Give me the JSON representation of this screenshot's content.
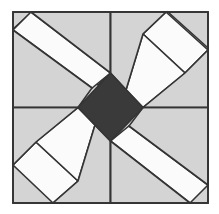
{
  "figure": {
    "type": "quilt-block-diagram",
    "width": 219,
    "height": 214,
    "background_color": "#ffffff",
    "symmetry": "180-degree rotational (2-fold)",
    "grid": "2x2 quadrants"
  },
  "palette": {
    "background": "#ffffff",
    "light_gray": "#d4d4d4",
    "white_patch": "#fbfbfb",
    "dark_gray": "#3a3a3a",
    "outline": "#343434",
    "outline_width": 1.6
  },
  "geometry": {
    "border": {
      "x0": 13,
      "y0": 12,
      "x1": 208,
      "y1": 203
    },
    "center": {
      "x": 110.5,
      "y": 107.5
    },
    "divider_vertical_x": 110.5,
    "divider_horizontal_y": 107.5,
    "center_diamond": {
      "top": [
        110.5,
        73
      ],
      "right": [
        143,
        107.5
      ],
      "bottom": [
        110.5,
        141
      ],
      "left": [
        78,
        107.5
      ],
      "fill": "dark_gray"
    }
  },
  "quadrants": [
    {
      "id": "top-left",
      "name": "Quadrant top-left",
      "description": "Light gray field with a single white diagonal band running from the upper-left corner toward the center, flanked by gray triangles."
    },
    {
      "id": "top-right",
      "name": "Quadrant top-right",
      "description": "Light gray field with a white chevron of two bands meeting near the center-left, opening toward the upper-right corner."
    },
    {
      "id": "bottom-left",
      "name": "Quadrant bottom-left",
      "description": "Light gray field with a white chevron of two bands meeting near the center-right, opening toward the lower-left corner."
    },
    {
      "id": "bottom-right",
      "name": "Quadrant bottom-right",
      "description": "Light gray field with a single white diagonal band running from the lower-right corner toward the center, flanked by gray triangles."
    }
  ],
  "pieces": [
    {
      "name": "outer-frame",
      "fill": "light_gray"
    },
    {
      "name": "center-diamond",
      "fill": "dark_gray"
    },
    {
      "name": "tl-white-band",
      "fill": "white_patch"
    },
    {
      "name": "tl-gray-corner-triangle",
      "fill": "light_gray"
    },
    {
      "name": "tl-gray-inner-triangle",
      "fill": "light_gray"
    },
    {
      "name": "tr-white-band-upper",
      "fill": "white_patch"
    },
    {
      "name": "tr-white-band-lower",
      "fill": "white_patch"
    },
    {
      "name": "tr-gray-wedge",
      "fill": "light_gray"
    },
    {
      "name": "bl-white-band-upper",
      "fill": "white_patch"
    },
    {
      "name": "bl-white-band-lower",
      "fill": "white_patch"
    },
    {
      "name": "bl-gray-wedge",
      "fill": "light_gray"
    },
    {
      "name": "br-white-band",
      "fill": "white_patch"
    },
    {
      "name": "br-gray-corner-triangle",
      "fill": "light_gray"
    },
    {
      "name": "br-gray-inner-triangle",
      "fill": "light_gray"
    }
  ]
}
